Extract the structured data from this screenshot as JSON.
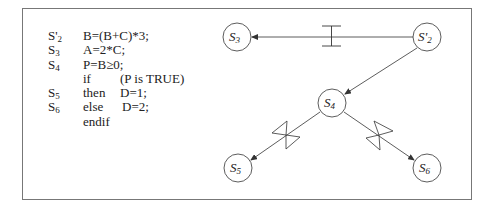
{
  "code": {
    "lines": [
      {
        "label": "S'",
        "label_sub": "2",
        "kw": "B=(B+C)*3;",
        "arg": ""
      },
      {
        "label": "S",
        "label_sub": "3",
        "kw": "A=2*C;",
        "arg": ""
      },
      {
        "label": "S",
        "label_sub": "4",
        "kw": "P=B≥0;",
        "arg": ""
      },
      {
        "label": "",
        "label_sub": "",
        "kw": "if",
        "arg": "(P is TRUE)"
      },
      {
        "label": "S",
        "label_sub": "5",
        "kw": "then",
        "arg": "D=1;"
      },
      {
        "label": "S",
        "label_sub": "6",
        "kw": "else",
        "arg": "D=2;"
      },
      {
        "label": "",
        "label_sub": "",
        "kw": "endif",
        "arg": ""
      }
    ]
  },
  "graph": {
    "nodes": [
      {
        "id": "S3",
        "label": "S",
        "sub": "3",
        "x": 237,
        "y": 37
      },
      {
        "id": "S2p",
        "label": "S'",
        "sub": "2",
        "x": 427,
        "y": 37
      },
      {
        "id": "S4",
        "label": "S",
        "sub": "4",
        "x": 332,
        "y": 103
      },
      {
        "id": "S5",
        "label": "S",
        "sub": "5",
        "x": 238,
        "y": 168
      },
      {
        "id": "S6",
        "label": "S",
        "sub": "6",
        "x": 427,
        "y": 168
      }
    ],
    "edges": [
      {
        "from": "S2p",
        "to": "S3",
        "marker": "i-beam"
      },
      {
        "from": "S2p",
        "to": "S4",
        "marker": "none"
      },
      {
        "from": "S4",
        "to": "S5",
        "marker": "bow-tie"
      },
      {
        "from": "S4",
        "to": "S6",
        "marker": "bow-tie"
      }
    ]
  },
  "colors": {
    "stroke": "#333333",
    "frame": "#777777"
  }
}
